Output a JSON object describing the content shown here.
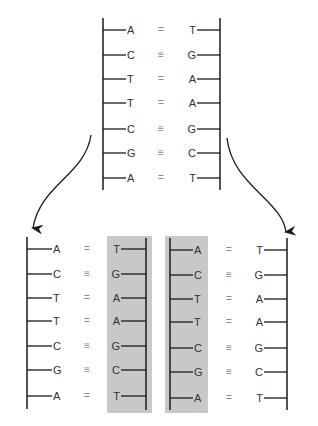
{
  "diagram": {
    "colors": {
      "line": "#1a1a1a",
      "text": "#333333",
      "bond": "#888888",
      "new_strand_bg": "#c8c8c8",
      "background": "#ffffff"
    },
    "parent": {
      "left_strand": [
        "A",
        "C",
        "T",
        "T",
        "C",
        "G",
        "A"
      ],
      "right_strand": [
        "T",
        "G",
        "A",
        "A",
        "G",
        "C",
        "T"
      ],
      "bonds": [
        "=",
        "≡",
        "=",
        "=",
        "≡",
        "≡",
        "="
      ]
    },
    "daughter_left": {
      "old_strand": [
        "A",
        "C",
        "T",
        "T",
        "C",
        "G",
        "A"
      ],
      "new_strand": [
        "T",
        "G",
        "A",
        "A",
        "G",
        "C",
        "T"
      ],
      "bonds": [
        "=",
        "≡",
        "=",
        "=",
        "≡",
        "≡",
        "="
      ],
      "new_strand_side": "right"
    },
    "daughter_right": {
      "new_strand": [
        "A",
        "C",
        "T",
        "T",
        "C",
        "G",
        "A"
      ],
      "old_strand": [
        "T",
        "G",
        "A",
        "A",
        "G",
        "C",
        "T"
      ],
      "bonds": [
        "=",
        "≡",
        "=",
        "=",
        "≡",
        "≡",
        "="
      ],
      "new_strand_side": "left"
    },
    "arrows": [
      {
        "name": "to-left-daughter",
        "from": [
          91,
          135
        ],
        "to": [
          33,
          233
        ]
      },
      {
        "name": "to-right-daughter",
        "from": [
          227,
          138
        ],
        "to": [
          286,
          238
        ]
      }
    ]
  }
}
